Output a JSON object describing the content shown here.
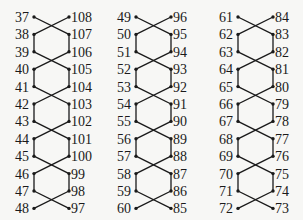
{
  "diagram": {
    "title": "",
    "line_color": "#1a1a1a",
    "columns": [
      {
        "left": [
          "37",
          "38",
          "39",
          "40",
          "41",
          "42",
          "43",
          "44",
          "45",
          "46",
          "47",
          "48"
        ],
        "right": [
          "108",
          "107",
          "106",
          "105",
          "104",
          "103",
          "102",
          "101",
          "100",
          "99",
          "98",
          "97"
        ]
      },
      {
        "left": [
          "49",
          "50",
          "51",
          "52",
          "53",
          "54",
          "55",
          "56",
          "57",
          "58",
          "59",
          "60"
        ],
        "right": [
          "96",
          "95",
          "94",
          "93",
          "92",
          "91",
          "90",
          "89",
          "88",
          "87",
          "86",
          "85"
        ]
      },
      {
        "left": [
          "61",
          "62",
          "63",
          "64",
          "65",
          "66",
          "67",
          "68",
          "69",
          "70",
          "71",
          "72"
        ],
        "right": [
          "84",
          "83",
          "82",
          "81",
          "80",
          "79",
          "78",
          "77",
          "76",
          "75",
          "74",
          "73"
        ]
      }
    ]
  }
}
